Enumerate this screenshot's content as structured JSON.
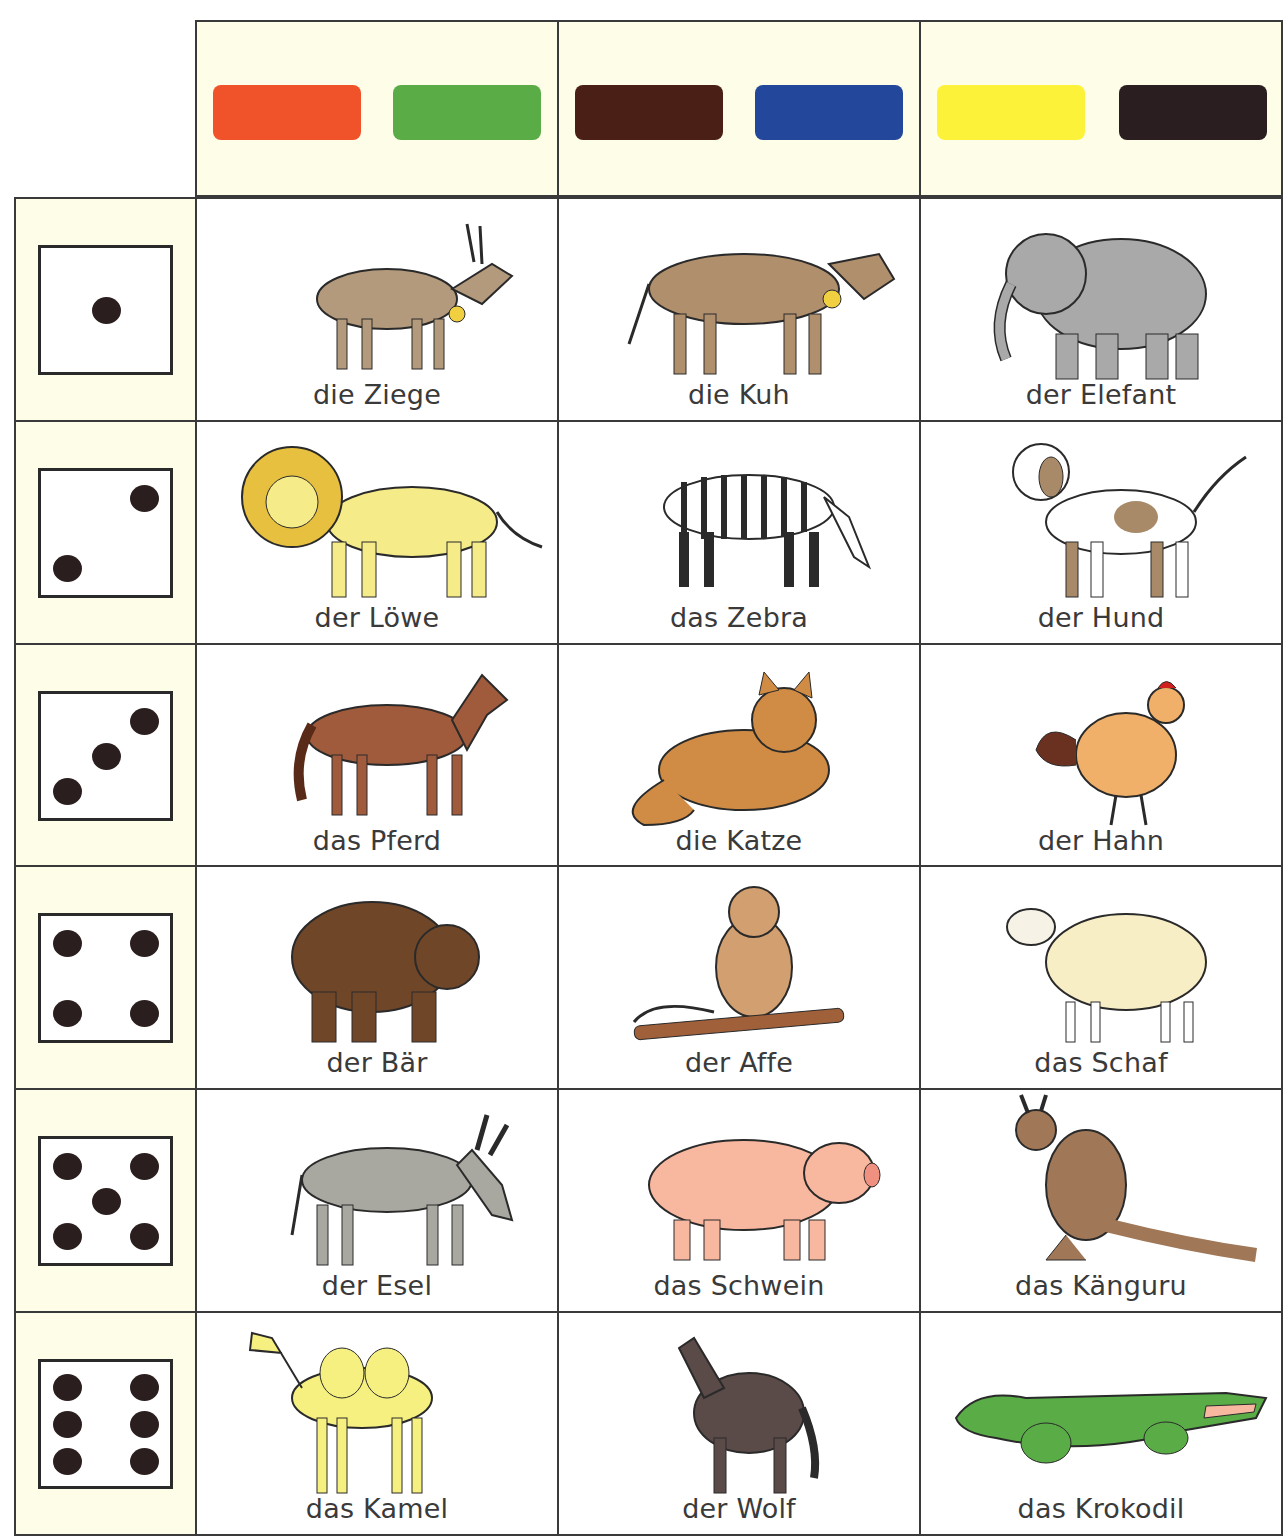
{
  "header": {
    "columns": [
      {
        "swatches": [
          {
            "name": "orange",
            "color": "#f0522a"
          },
          {
            "name": "green",
            "color": "#5aac46"
          }
        ]
      },
      {
        "swatches": [
          {
            "name": "brown",
            "color": "#4a2016"
          },
          {
            "name": "blue",
            "color": "#23479a"
          }
        ]
      },
      {
        "swatches": [
          {
            "name": "yellow",
            "color": "#fdf23a"
          },
          {
            "name": "black",
            "color": "#2a1e20"
          }
        ]
      }
    ]
  },
  "rows": [
    {
      "dice": 1,
      "animals": [
        {
          "label": "die Ziege",
          "icon": "goat",
          "color": "#b39a7c"
        },
        {
          "label": "die Kuh",
          "icon": "cow",
          "color": "#b08f6d"
        },
        {
          "label": "der Elefant",
          "icon": "elephant",
          "color": "#a9a9a9"
        }
      ]
    },
    {
      "dice": 2,
      "animals": [
        {
          "label": "der Löwe",
          "icon": "lion",
          "color": "#f5eb88"
        },
        {
          "label": "das Zebra",
          "icon": "zebra",
          "color": "#ffffff"
        },
        {
          "label": "der Hund",
          "icon": "dog",
          "color": "#a88a68"
        }
      ]
    },
    {
      "dice": 3,
      "animals": [
        {
          "label": "das Pferd",
          "icon": "horse",
          "color": "#a05a3c"
        },
        {
          "label": "die Katze",
          "icon": "cat",
          "color": "#d08c44"
        },
        {
          "label": "der Hahn",
          "icon": "rooster",
          "color": "#f0b06a"
        }
      ]
    },
    {
      "dice": 4,
      "animals": [
        {
          "label": "der Bär",
          "icon": "bear",
          "color": "#704628"
        },
        {
          "label": "der Affe",
          "icon": "monkey",
          "color": "#d2a070"
        },
        {
          "label": "das Schaf",
          "icon": "sheep",
          "color": "#f8eec6"
        }
      ]
    },
    {
      "dice": 5,
      "animals": [
        {
          "label": "der Esel",
          "icon": "donkey",
          "color": "#a8a8a0"
        },
        {
          "label": "das Schwein",
          "icon": "pig",
          "color": "#f8b8a0"
        },
        {
          "label": "das Känguru",
          "icon": "kangaroo",
          "color": "#a07858"
        }
      ]
    },
    {
      "dice": 6,
      "animals": [
        {
          "label": "das Kamel",
          "icon": "camel",
          "color": "#f6f080"
        },
        {
          "label": "der Wolf",
          "icon": "wolf",
          "color": "#5a4a48"
        },
        {
          "label": "das Krokodil",
          "icon": "crocodile",
          "color": "#5aac46"
        }
      ]
    }
  ]
}
